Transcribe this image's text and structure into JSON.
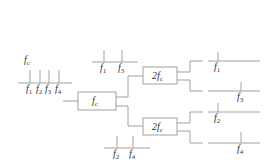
{
  "diagram": {
    "title": "",
    "input_spectrum": {
      "carrier_label": {
        "base": "f",
        "sub": "c"
      },
      "tones": [
        {
          "base": "f",
          "sub": "1"
        },
        {
          "base": "f",
          "sub": "2"
        },
        {
          "base": "f",
          "sub": "3"
        },
        {
          "base": "f",
          "sub": "4"
        }
      ]
    },
    "stage1": {
      "box_label": {
        "prefix": "",
        "base": "f",
        "sub": "c"
      },
      "upper_output_tones": [
        {
          "base": "f",
          "sub": "1"
        },
        {
          "base": "f",
          "sub": "3"
        }
      ],
      "lower_output_tones": [
        {
          "base": "f",
          "sub": "2"
        },
        {
          "base": "f",
          "sub": "4"
        }
      ]
    },
    "stage2": {
      "upper_box_label": {
        "prefix": "2",
        "base": "f",
        "sub": "c"
      },
      "lower_box_label": {
        "prefix": "2",
        "base": "f",
        "sub": "c"
      }
    },
    "outputs": [
      {
        "base": "f",
        "sub": "1"
      },
      {
        "base": "f",
        "sub": "3"
      },
      {
        "base": "f",
        "sub": "2"
      },
      {
        "base": "f",
        "sub": "4"
      }
    ],
    "colors": {
      "line": "#8a8a8a",
      "text": "#333333",
      "background": "#ffffff"
    }
  }
}
